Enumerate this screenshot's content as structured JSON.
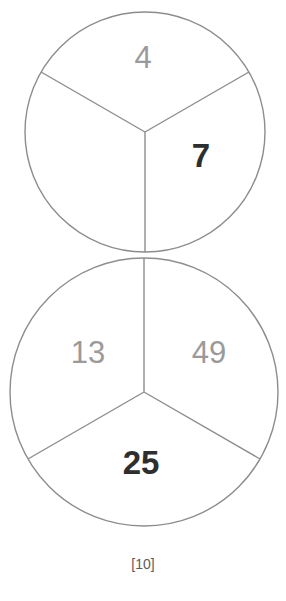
{
  "page": {
    "caption": "[10]",
    "background_color": "#ffffff",
    "stroke_color": "#8d8d8d",
    "light_number_color": "#9a9a9a",
    "dark_number_color": "#2e2e2e"
  },
  "diagram": {
    "type": "two-tangent-circles-divided-in-thirds",
    "circles": [
      {
        "id": "top-circle",
        "name": "top-circle",
        "center_x": 145,
        "center_y": 132,
        "radius": 120,
        "clipped_at_top": true,
        "sectors": [
          {
            "id": "top-sector-upper",
            "name": "top-circle-sector-top",
            "value": "4",
            "emphasis": "light",
            "x": 143,
            "y": 57,
            "font_size": 31
          },
          {
            "id": "top-sector-right",
            "name": "top-circle-sector-right",
            "value": "7",
            "emphasis": "dark",
            "x": 201,
            "y": 155,
            "font_size": 33
          },
          {
            "id": "top-sector-left",
            "name": "top-circle-sector-left",
            "value": "",
            "emphasis": "light",
            "x": 85,
            "y": 180,
            "font_size": 31
          }
        ]
      },
      {
        "id": "bottom-circle",
        "name": "bottom-circle",
        "center_x": 144,
        "center_y": 392,
        "radius": 134,
        "clipped_at_top": false,
        "sectors": [
          {
            "id": "bottom-sector-left",
            "name": "bottom-circle-sector-left",
            "value": "13",
            "emphasis": "light",
            "x": 88,
            "y": 352,
            "font_size": 31
          },
          {
            "id": "bottom-sector-right",
            "name": "bottom-circle-sector-right",
            "value": "49",
            "emphasis": "light",
            "x": 209,
            "y": 352,
            "font_size": 31
          },
          {
            "id": "bottom-sector-bottom",
            "name": "bottom-circle-sector-bottom",
            "value": "25",
            "emphasis": "dark",
            "x": 141,
            "y": 462,
            "font_size": 33
          }
        ]
      }
    ],
    "tangent_point": {
      "x": 145,
      "y": 258
    },
    "numbers_in_reading_order": [
      "4",
      "7",
      "13",
      "49",
      "25"
    ]
  }
}
